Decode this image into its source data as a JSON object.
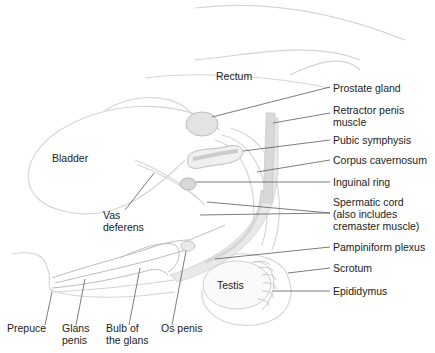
{
  "diagram": {
    "kind": "anatomical",
    "colors": {
      "outline": "#cfcfcf",
      "structure_fill": "#e6e6e6",
      "muscle_fill": "#d9d9d9",
      "leader_line": "#555555",
      "text": "#222222"
    },
    "internal_labels": {
      "rectum": "Rectum",
      "bladder": "Bladder",
      "testis": "Testis",
      "vas_deferens_line1": "Vas",
      "vas_deferens_line2": "deferens"
    },
    "right_labels": {
      "prostate_gland": "Prostate gland",
      "retractor_penis_line1": "Retractor penis",
      "retractor_penis_line2": "muscle",
      "pubic_symphysis": "Pubic symphysis",
      "corpus_cavernosum": "Corpus cavernosum",
      "inguinal_ring": "Inguinal ring",
      "spermatic_cord_line1": "Spermatic cord",
      "spermatic_cord_line2": "(also includes",
      "spermatic_cord_line3": "cremaster muscle)",
      "pampiniform_plexus": "Pampiniform plexus",
      "scrotum": "Scrotum",
      "epididymus": "Epididymus"
    },
    "bottom_labels": {
      "prepuce": "Prepuce",
      "glans_penis_line1": "Glans",
      "glans_penis_line2": "penis",
      "bulb_line1": "Bulb of",
      "bulb_line2": "the glans",
      "os_penis": "Os penis"
    }
  }
}
